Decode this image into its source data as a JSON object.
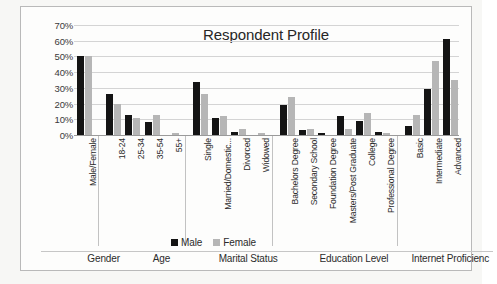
{
  "chart_data": {
    "type": "bar",
    "title": "Respondent Profile",
    "xlabel": "",
    "ylabel": "",
    "ylim": [
      0,
      70
    ],
    "grid": true,
    "legend_position": "bottom-center",
    "y_ticks": [
      "0%",
      "10%",
      "20%",
      "30%",
      "40%",
      "50%",
      "60%",
      "70%"
    ],
    "y_tick_values": [
      0,
      10,
      20,
      30,
      40,
      50,
      60,
      70
    ],
    "categories": [
      "Male/Female",
      "18-24",
      "25-34",
      "35-54",
      "55+",
      "Single",
      "Married/Domestic...",
      "Divorced",
      "Widowed",
      "Bachelors Degree",
      "Secondary School",
      "Foundation Degree",
      "Masters/Post Graduate",
      "College",
      "Professional Degree",
      "Basic",
      "Intermediate",
      "Advanced"
    ],
    "series": [
      {
        "name": "Male",
        "color": "#141414",
        "values": [
          50,
          26,
          13,
          8,
          0,
          34,
          11,
          2,
          0,
          19,
          3,
          1,
          12,
          9,
          2,
          6,
          29,
          61
        ]
      },
      {
        "name": "Female",
        "color": "#b6b6b6",
        "values": [
          50,
          20,
          11,
          13,
          1,
          26,
          12,
          4,
          1,
          24,
          4,
          0,
          4,
          14,
          1,
          13,
          47,
          35
        ]
      }
    ],
    "groups": [
      {
        "label": "Gender",
        "start": 0,
        "count": 1
      },
      {
        "label": "Age",
        "start": 1,
        "count": 4
      },
      {
        "label": "Marital Status",
        "start": 5,
        "count": 4
      },
      {
        "label": "Education Level",
        "start": 9,
        "count": 6
      },
      {
        "label": "Internet Proficienc",
        "start": 15,
        "count": 3
      }
    ]
  },
  "legend": {
    "male_label": "Male",
    "female_label": "Female"
  }
}
